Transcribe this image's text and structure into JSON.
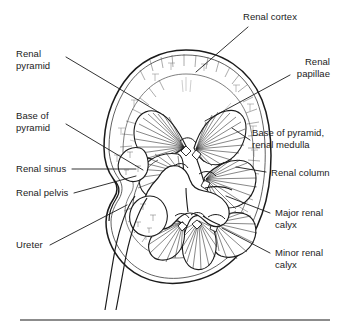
{
  "figure": {
    "background_color": "#ffffff",
    "ink_color": "#1b1b1b",
    "leader_color": "#1b1b1b"
  },
  "labels": {
    "renal_pyramid": "Renal\npyramid",
    "base_of_pyramid": "Base of\npyramid",
    "renal_sinus": "Renal sinus",
    "renal_pelvis": "Renal pelvis",
    "ureter": "Ureter",
    "renal_cortex": "Renal cortex",
    "renal_papillae": "Renal\npapillae",
    "base_of_pyramid_renal_medulla": "Base of pyramid,\nrenal medulla",
    "renal_column": "Renal column",
    "major_renal_calyx": "Major renal\ncalyx",
    "minor_renal_calyx": "Minor renal\ncalyx"
  },
  "structures": [
    {
      "name": "renal-capsule-outline",
      "description": "Outer bean-shaped kidney border"
    },
    {
      "name": "renal-cortex-band",
      "description": "Outer stippled cortical zone"
    },
    {
      "name": "renal-pyramid",
      "description": "Fan-shaped medullary pyramid",
      "count": 7
    },
    {
      "name": "renal-column",
      "description": "Cortical tissue between pyramids"
    },
    {
      "name": "renal-sinus",
      "description": "Fat-filled cavity at the hilum"
    },
    {
      "name": "renal-pelvis",
      "description": "Funnel-shaped collecting chamber"
    },
    {
      "name": "major-renal-calyx",
      "description": "Large branch of renal pelvis"
    },
    {
      "name": "minor-renal-calyx",
      "description": "Cup around a renal papilla"
    },
    {
      "name": "ureter",
      "description": "Tube leaving the hilum inferiorly"
    }
  ],
  "footer_rule": {
    "visible": true
  }
}
